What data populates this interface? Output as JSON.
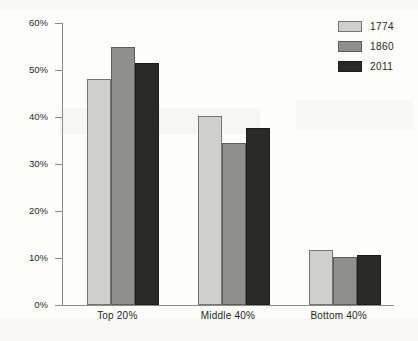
{
  "chart_data": {
    "type": "bar",
    "title": "",
    "subtitle": "",
    "xlabel": "",
    "ylabel": "",
    "categories": [
      "Top 20%",
      "Middle 40%",
      "Bottom 40%"
    ],
    "series": [
      {
        "name": "1774",
        "color": "#cfcfcd",
        "values": [
          48.0,
          40.3,
          11.6
        ]
      },
      {
        "name": "1860",
        "color": "#8f8f8c",
        "values": [
          55.0,
          34.5,
          10.2
        ]
      },
      {
        "name": "2011",
        "color": "#2a2a29",
        "values": [
          51.5,
          37.6,
          10.6
        ]
      }
    ],
    "ylim": [
      0,
      60
    ],
    "yticks": [
      0,
      10,
      20,
      30,
      40,
      50,
      60
    ],
    "ytick_labels": [
      "0%",
      "10%",
      "20%",
      "30%",
      "40%",
      "50%",
      "60%"
    ],
    "grid": false,
    "legend_position": "top-right",
    "value_format": "percent"
  },
  "legend": {
    "entries": [
      {
        "label": "1774",
        "swatch": "legend-swatch-1774"
      },
      {
        "label": "1860",
        "swatch": "legend-swatch-1860"
      },
      {
        "label": "2011",
        "swatch": "legend-swatch-2011"
      }
    ]
  }
}
